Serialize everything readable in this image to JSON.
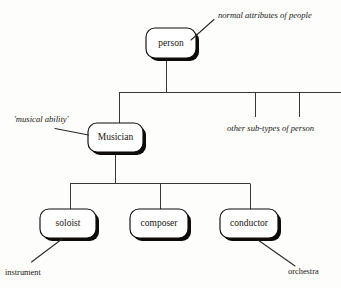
{
  "diagram": {
    "type": "tree",
    "background_color": "#fdfdfc",
    "line_color": "#3a3733",
    "box_fill": "#ffffff",
    "box_stroke": "#100d0a",
    "text_color": "#16130f"
  },
  "nodes": {
    "person": {
      "label": "person",
      "x": 171,
      "y": 43
    },
    "musician": {
      "label": "Musician",
      "x": 115.5,
      "y": 137.5
    },
    "soloist": {
      "label": "soloist",
      "x": 70,
      "y": 224
    },
    "composer": {
      "label": "composer",
      "x": 160,
      "y": 224
    },
    "conductor": {
      "label": "conductor",
      "x": 250,
      "y": 224
    }
  },
  "annotations": {
    "normal_attributes": {
      "text": "normal attributes of people",
      "style": "italic"
    },
    "musical_ability": {
      "text": "'musical ability'",
      "style": "italic"
    },
    "other_subtypes": {
      "text": "other sub-types of person",
      "style": "italic"
    },
    "instrument": {
      "text": "instrument",
      "style": "plain"
    },
    "orchestra": {
      "text": "orchestra",
      "style": "plain"
    }
  },
  "edges": [
    {
      "from": "person",
      "to": "bus-1",
      "kind": "stem"
    },
    {
      "from": "bus-1",
      "to": "musician",
      "kind": "drop"
    },
    {
      "from": "bus-1",
      "to": "other-subtype-stub-1",
      "kind": "stub"
    },
    {
      "from": "bus-1",
      "to": "other-subtype-stub-2",
      "kind": "stub"
    },
    {
      "from": "musician",
      "to": "bus-2",
      "kind": "stem"
    },
    {
      "from": "bus-2",
      "to": "soloist",
      "kind": "drop"
    },
    {
      "from": "bus-2",
      "to": "composer",
      "kind": "drop"
    },
    {
      "from": "bus-2",
      "to": "conductor",
      "kind": "drop"
    }
  ],
  "leaders": [
    {
      "from": "normal_attributes",
      "to": "person"
    },
    {
      "from": "musical_ability",
      "to": "musician"
    },
    {
      "from": "instrument",
      "to": "soloist"
    },
    {
      "from": "orchestra",
      "to": "conductor"
    }
  ]
}
